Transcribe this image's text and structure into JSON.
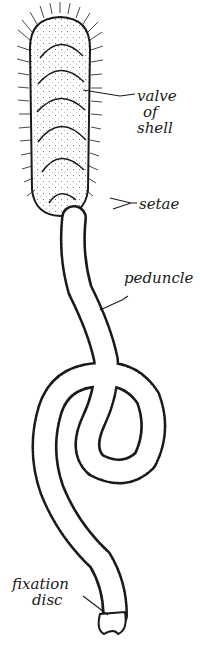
{
  "figure": {
    "labels": {
      "valve": [
        "valve",
        "of",
        "shell"
      ],
      "setae": "setae",
      "peduncle": "peduncle",
      "fixation": [
        "fixation",
        "disc"
      ]
    },
    "colors": {
      "ink": "#1a1a1a",
      "background": "#ffffff"
    }
  }
}
